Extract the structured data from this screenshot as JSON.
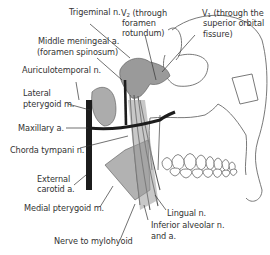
{
  "diagram": {
    "colors": {
      "muscle_fill": "#a9a9a9",
      "nerve_fill": "#8d8d8d",
      "artery": "#1f1f1f",
      "bone_outline": "#555555",
      "leader_line": "#333333"
    },
    "labels": {
      "trigeminal": "Trigeminal n.",
      "v2_prefix": "V",
      "v2_sub": "2",
      "v2_line1": " (through",
      "v2_line2": "foramen",
      "v2_line3": "rotundum)",
      "v1_prefix": "V",
      "v1_sub": "1",
      "v1_line1": " (through the",
      "v1_line2": "superior orbital",
      "v1_line3": "fissure)",
      "middle_meningeal_line1": "Middle meningeal a.",
      "middle_meningeal_line2": "(foramen spinosum)",
      "auriculotemporal": "Auriculotemporal n.",
      "lateral_pterygoid_line1": "Lateral",
      "lateral_pterygoid_line2": "pterygoid m.",
      "maxillary_artery": "Maxillary a.",
      "chorda_tympani": "Chorda tympani n.",
      "external_carotid_line1": "External",
      "external_carotid_line2": "carotid a.",
      "medial_pterygoid": "Medial pterygoid m.",
      "nerve_to_mylohyoid": "Nerve to mylohyoid",
      "lingual": "Lingual n.",
      "inferior_alveolar_line1": "Inferior alveolar n.",
      "inferior_alveolar_line2": "and a."
    }
  }
}
